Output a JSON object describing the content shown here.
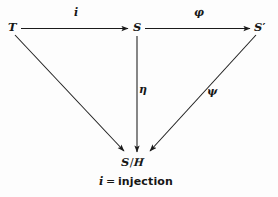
{
  "figure": {
    "type": "commutative-diagram",
    "width": 278,
    "height": 197,
    "background_color": "#fdfdfd",
    "ink_color": "#1b1b1b"
  },
  "nodes": {
    "top_left": {
      "label": "T",
      "x": 8,
      "y": 22
    },
    "top_middle": {
      "label": "S",
      "x": 133,
      "y": 22
    },
    "top_right": {
      "label": "S",
      "prime": "′",
      "x": 254,
      "y": 22
    },
    "bottom": {
      "label": "S",
      "slash": "/",
      "script": "H",
      "x": 121,
      "y": 157
    }
  },
  "edges": [
    {
      "name": "T-to-S",
      "label": "i",
      "style": "italic-latin",
      "label_x": 74,
      "label_y": 7
    },
    {
      "name": "S-to-Sprime",
      "label": "φ",
      "style": "greek",
      "label_x": 194,
      "label_y": 7
    },
    {
      "name": "S-to-quotient",
      "label": "η",
      "style": "greek",
      "label_x": 139,
      "label_y": 84
    },
    {
      "name": "Sprime-to-quotient",
      "label": "ψ",
      "style": "greek-slant",
      "label_x": 207,
      "label_y": 86
    },
    {
      "name": "T-to-quotient",
      "label": "",
      "style": "none"
    }
  ],
  "caption": {
    "symbol": "i",
    "relation": "=",
    "text": "injection",
    "x": 99,
    "y": 176
  }
}
